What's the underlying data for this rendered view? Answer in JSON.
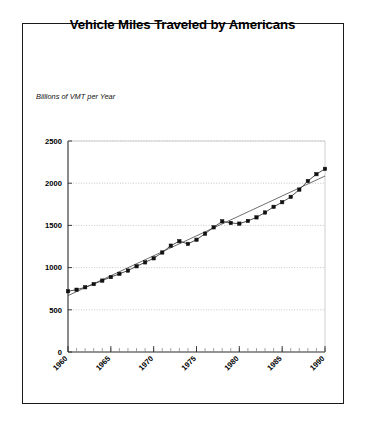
{
  "figure": {
    "title": "Vehicle Miles Traveled by Americans",
    "y_axis_caption": "Billions of VMT per Year"
  },
  "chart_data": {
    "type": "line",
    "title": "Vehicle Miles Traveled by Americans",
    "subtitle": "",
    "xlabel": "",
    "ylabel": "Billions of VMT per Year",
    "xlim": [
      1960,
      1990
    ],
    "ylim": [
      0,
      2500
    ],
    "grid": true,
    "grid_axis": "y",
    "legend": false,
    "marker": "filled-square",
    "x_tick_labels": [
      "1960",
      "1965",
      "1970",
      "1975",
      "1980",
      "1985",
      "1990"
    ],
    "x_tick_values": [
      1960,
      1965,
      1970,
      1975,
      1980,
      1985,
      1990
    ],
    "x_minor_tick_step": 1,
    "y_tick_labels": [
      "0",
      "500",
      "1000",
      "1500",
      "2000",
      "2500"
    ],
    "y_tick_values": [
      0,
      500,
      1000,
      1500,
      2000,
      2500
    ],
    "series": [
      {
        "name": "Vehicle Miles Traveled",
        "style": "markers-with-line",
        "x": [
          1960,
          1961,
          1962,
          1963,
          1964,
          1965,
          1966,
          1967,
          1968,
          1969,
          1970,
          1971,
          1972,
          1973,
          1974,
          1975,
          1976,
          1977,
          1978,
          1979,
          1980,
          1981,
          1982,
          1983,
          1984,
          1985,
          1986,
          1987,
          1988,
          1989,
          1990
        ],
        "values": [
          720,
          738,
          767,
          805,
          846,
          888,
          926,
          965,
          1016,
          1062,
          1110,
          1179,
          1260,
          1313,
          1281,
          1330,
          1402,
          1477,
          1548,
          1529,
          1521,
          1553,
          1595,
          1653,
          1720,
          1775,
          1838,
          1924,
          2026,
          2107,
          2170
        ]
      },
      {
        "name": "Linear trend",
        "style": "thin-line",
        "x": [
          1960,
          1990
        ],
        "values": [
          668,
          2085
        ]
      }
    ]
  }
}
